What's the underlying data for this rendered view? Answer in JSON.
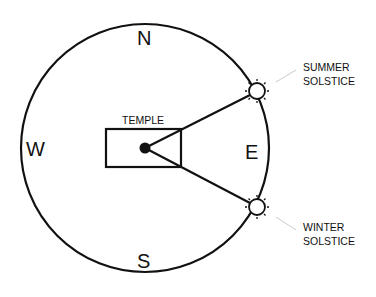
{
  "diagram": {
    "directions": {
      "north": "N",
      "south": "S",
      "east": "E",
      "west": "W"
    },
    "temple_label": "TEMPLE",
    "summer": {
      "line1": "SUMMER",
      "line2": "SOLSTICE",
      "icon": "sun-icon"
    },
    "winter": {
      "line1": "WINTER",
      "line2": "SOLSTICE",
      "icon": "sun-icon"
    },
    "colors": {
      "stroke": "#111111",
      "leader": "#cccccc",
      "background": "#ffffff"
    }
  }
}
